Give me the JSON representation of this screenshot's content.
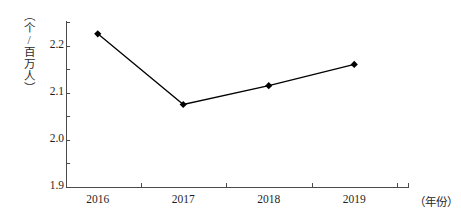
{
  "chart_data": {
    "type": "line",
    "title": "",
    "subtitle": "",
    "xlabel": "（年份）",
    "ylabel": "（个/百万人）",
    "categories": [
      "2016",
      "2017",
      "2018",
      "2019"
    ],
    "x": [
      2016,
      2017,
      2018,
      2019
    ],
    "values": [
      2.15,
      1.85,
      1.93,
      2.02
    ],
    "series": [
      {
        "name": "",
        "values": [
          2.15,
          1.85,
          1.93,
          2.02
        ]
      }
    ],
    "ylim": [
      1.5,
      2.2
    ],
    "yticks": [
      "2.2",
      "2.1",
      "2.0",
      "1.9",
      "1.8",
      "1.7",
      "1.6",
      "1.5"
    ],
    "ytick_values": [
      2.2,
      2.1,
      2.0,
      1.9,
      1.8,
      1.7,
      1.6,
      1.5
    ],
    "grid": false,
    "legend": "none",
    "marker": "diamond",
    "line_color": "#000000",
    "marker_color": "#000000",
    "axis_color": "#4a4a4a"
  }
}
